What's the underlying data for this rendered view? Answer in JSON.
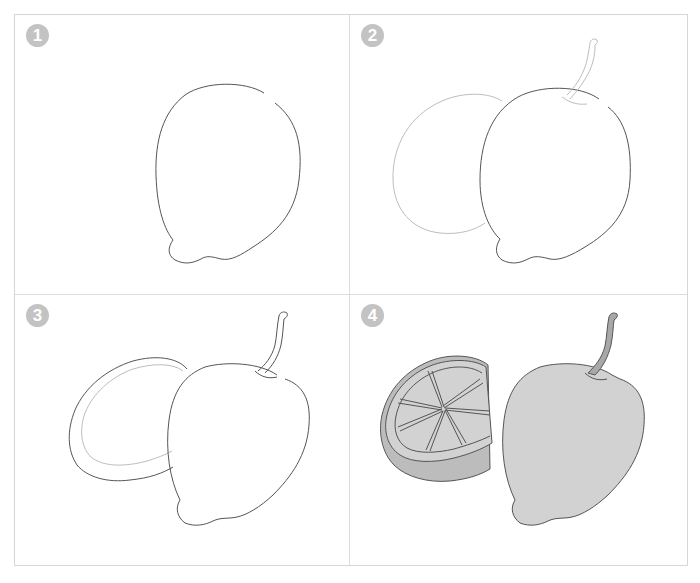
{
  "steps": [
    {
      "number": "1",
      "description": "Outline of whole lemon"
    },
    {
      "number": "2",
      "description": "Add stem and faint outline of cut half behind"
    },
    {
      "number": "3",
      "description": "Ink cut half with rind line"
    },
    {
      "number": "4",
      "description": "Add segments and grey shading"
    }
  ],
  "colors": {
    "outline": "#555555",
    "faint_outline": "#bdbdbd",
    "fill": "#d2d2d2",
    "fill_dark": "#bcbcbc",
    "stem_fill": "#a8a8a8",
    "badge": "#c3c3c3",
    "border": "#d6d6d6"
  }
}
